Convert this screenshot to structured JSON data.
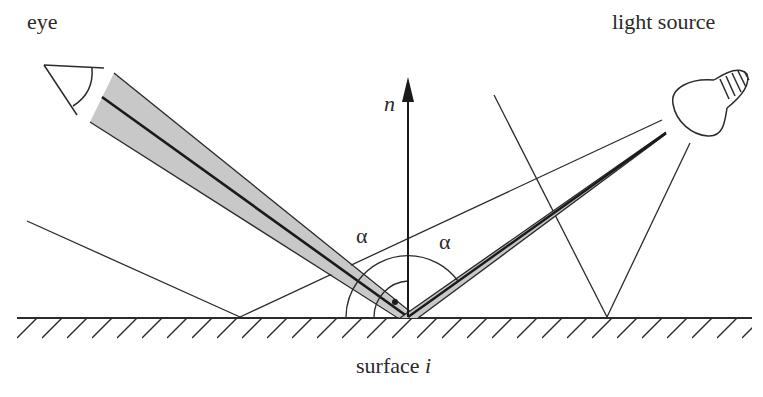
{
  "diagram": {
    "type": "specular reflection geometry",
    "labels": {
      "eye": "eye",
      "light_source": "light source",
      "normal": "n",
      "angle_left": "α",
      "angle_right": "α",
      "surface": "surface",
      "surface_index": "i"
    },
    "colors": {
      "stroke": "#2b2b2b",
      "beam_fill": "#c8c8c8",
      "background": "#ffffff"
    },
    "elements": [
      "eye-icon",
      "light-bulb-icon",
      "normal-vector-arrow",
      "view-beam",
      "light-beam",
      "surface-hatched",
      "angle-arcs",
      "auxiliary-rays"
    ]
  }
}
